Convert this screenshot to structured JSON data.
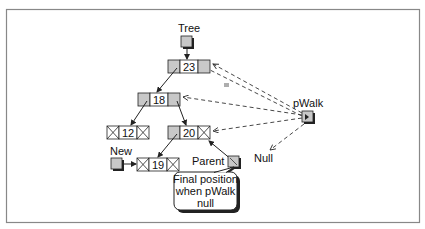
{
  "diagram": {
    "labels": {
      "tree": "Tree",
      "new": "New",
      "parent": "Parent",
      "pwalk": "pWalk",
      "null": "Null"
    },
    "nodes": [
      {
        "id": "n23",
        "value": "23",
        "left": "pointer",
        "right": "pointer"
      },
      {
        "id": "n18",
        "value": "18",
        "left": "pointer",
        "right": "pointer"
      },
      {
        "id": "n20",
        "value": "20",
        "left": "pointer",
        "right": "null"
      },
      {
        "id": "n12",
        "value": "12",
        "left": "null",
        "right": "null"
      },
      {
        "id": "n19",
        "value": "19",
        "left": "null",
        "right": "null"
      }
    ],
    "callout": {
      "line1": "Final position",
      "line2": "when pWalk",
      "line3": "null"
    },
    "colors": {
      "pointer_fill": "#c8c8c8",
      "node_fill": "#ffffff",
      "line": "#222222",
      "frame": "#888888"
    }
  }
}
